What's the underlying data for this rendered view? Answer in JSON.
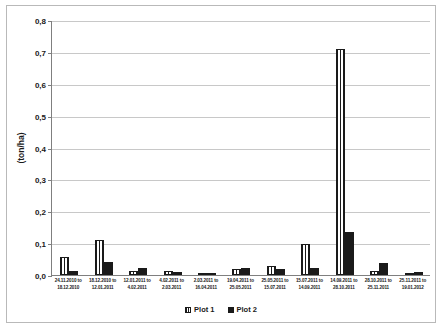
{
  "chart_data": {
    "type": "bar",
    "title": "",
    "subtitle": "",
    "xlabel": "",
    "ylabel": "(ton/ha)",
    "ylim": [
      0,
      0.8
    ],
    "ytick_labels": [
      "0,0",
      "0,1",
      "0,2",
      "0,3",
      "0,4",
      "0,5",
      "0,6",
      "0,7",
      "0,8"
    ],
    "ytick_values": [
      0,
      0.1,
      0.2,
      0.3,
      0.4,
      0.5,
      0.6,
      0.7,
      0.8
    ],
    "grid": "horizontal",
    "legend_position": "bottom",
    "decimal_separator": ",",
    "categories": [
      "24.11.2010 to 18.12.2010",
      "18.12.2010 to 12.01.2011",
      "12.01.2011 to 4.02.2011",
      "4.02.2011 to 2.03.2011",
      "2.03.2011 to 16.04.2011",
      "19.04.2011 to 25.05.2011",
      "25.05.2011 to 15.07.2011",
      "15.07.2011 to 14.09.2011",
      "14.09.2011 to 28.10.2011",
      "28.10.2011 to 25.11.2011",
      "25.11.2011 to 19.01.2012"
    ],
    "categories_lines": [
      [
        "24.11.2010 to",
        "18.12.2010"
      ],
      [
        "18.12.2010 to",
        "12.01.2011"
      ],
      [
        "12.01.2011 to",
        "4.02.2011"
      ],
      [
        "4.02.2011 to",
        "2.03.2011"
      ],
      [
        "2.03.2011 to",
        "16.04.2011"
      ],
      [
        "19.04.2011 to",
        "25.05.2011"
      ],
      [
        "25.05.2011 to",
        "15.07.2011"
      ],
      [
        "15.07.2011 to",
        "14.09.2011"
      ],
      [
        "14.09.2011 to",
        "28.10.2011"
      ],
      [
        "28.10.2011 to",
        "25.11.2011"
      ],
      [
        "25.11.2011 to",
        "19.01.2012"
      ]
    ],
    "series": [
      {
        "name": "Plot 1",
        "fill": "vertical-stripes",
        "color": "#1a1a1a",
        "values": [
          0.055,
          0.111,
          0.013,
          0.013,
          0.005,
          0.018,
          0.027,
          0.098,
          0.71,
          0.014,
          0.007
        ]
      },
      {
        "name": "Plot 2",
        "fill": "solid",
        "color": "#1a1a1a",
        "values": [
          0.013,
          0.041,
          0.021,
          0.008,
          0.007,
          0.022,
          0.019,
          0.023,
          0.135,
          0.039,
          0.008
        ]
      }
    ]
  },
  "legend": {
    "items": [
      {
        "label": "Plot 1"
      },
      {
        "label": "Plot 2"
      }
    ]
  }
}
